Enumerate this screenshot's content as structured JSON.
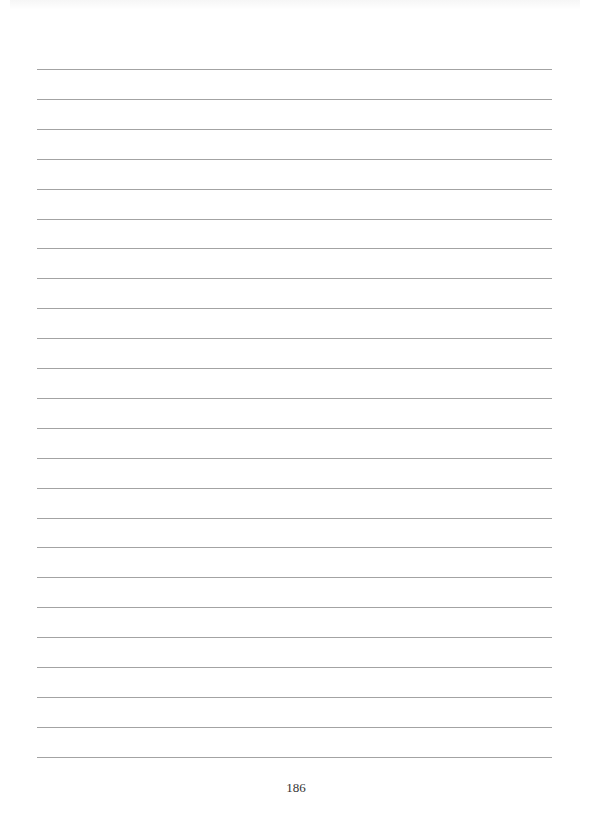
{
  "page": {
    "type": "ruled notes page",
    "line_count": 24,
    "line_color": "#a3a3a3",
    "page_number": "186"
  }
}
